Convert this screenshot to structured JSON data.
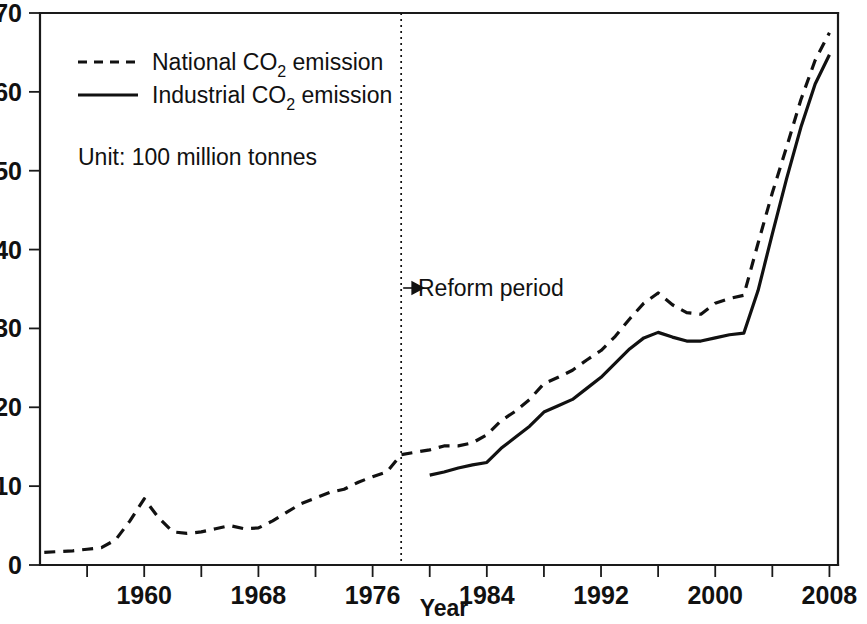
{
  "chart_data": {
    "type": "line",
    "title": "",
    "subtitle": "",
    "xlabel": "Year",
    "ylabel": "",
    "unit_note": "Unit: 100 million tonnes",
    "xlim": [
      1952.7,
      2008.6
    ],
    "ylim": [
      0,
      70
    ],
    "xticks": [
      1960,
      1968,
      1976,
      1984,
      1992,
      2000,
      2008
    ],
    "xtick_labels": [
      "1960",
      "1968",
      "1976",
      "1984",
      "1992",
      "2000",
      "2008"
    ],
    "xminor_ticks": [
      1956,
      1964,
      1972,
      1980,
      1988,
      1996,
      2004
    ],
    "yticks": [
      0,
      10,
      20,
      30,
      40,
      50,
      60,
      70
    ],
    "ytick_labels": [
      "0",
      "10",
      "20",
      "30",
      "40",
      "50",
      "60",
      "70"
    ],
    "grid": false,
    "legend_position": "upper-left",
    "annotations": [
      {
        "name": "reform-period",
        "text": "Reform period",
        "arrow": "→",
        "x": 1978,
        "y": 35,
        "marker": "vertical dotted line at 1978"
      }
    ],
    "series": [
      {
        "name": "National CO2 emission",
        "label_html": "National CO<sub>2</sub> emission",
        "style": "dashed",
        "color": "#111111",
        "x": [
          1953,
          1954,
          1955,
          1956,
          1957,
          1958,
          1959,
          1960,
          1961,
          1962,
          1963,
          1964,
          1965,
          1966,
          1967,
          1968,
          1969,
          1970,
          1971,
          1972,
          1973,
          1974,
          1975,
          1976,
          1977,
          1978,
          1979,
          1980,
          1981,
          1982,
          1983,
          1984,
          1985,
          1986,
          1987,
          1988,
          1989,
          1990,
          1991,
          1992,
          1993,
          1994,
          1995,
          1996,
          1997,
          1998,
          1999,
          2000,
          2001,
          2002,
          2003,
          2004,
          2005,
          2006,
          2007,
          2008
        ],
        "y": [
          1.6,
          1.7,
          1.8,
          2.0,
          2.2,
          3.2,
          5.6,
          8.4,
          6.0,
          4.2,
          4.0,
          4.2,
          4.6,
          5.0,
          4.6,
          4.7,
          5.6,
          6.7,
          7.8,
          8.5,
          9.2,
          9.6,
          10.5,
          11.2,
          11.8,
          14.0,
          14.3,
          14.6,
          15.1,
          15.1,
          15.5,
          16.5,
          18.3,
          19.5,
          21.0,
          23.0,
          23.8,
          24.7,
          26.0,
          27.2,
          29.0,
          31.2,
          33.2,
          34.5,
          33.0,
          32.0,
          31.8,
          33.2,
          33.8,
          34.2,
          40.8,
          47.2,
          53.0,
          59.0,
          64.0,
          67.5
        ]
      },
      {
        "name": "Industrial CO2 emission",
        "label_html": "Industrial CO<sub>2</sub> emission",
        "style": "solid",
        "color": "#111111",
        "x": [
          1980,
          1981,
          1982,
          1983,
          1984,
          1985,
          1986,
          1987,
          1988,
          1989,
          1990,
          1991,
          1992,
          1993,
          1994,
          1995,
          1996,
          1997,
          1998,
          1999,
          2000,
          2001,
          2002,
          2003,
          2004,
          2005,
          2006,
          2007,
          2008
        ],
        "y": [
          11.4,
          11.8,
          12.3,
          12.7,
          13.0,
          14.8,
          16.2,
          17.6,
          19.4,
          20.2,
          21.0,
          22.4,
          23.8,
          25.6,
          27.4,
          28.8,
          29.5,
          28.9,
          28.4,
          28.4,
          28.8,
          29.2,
          29.4,
          34.8,
          42.0,
          49.0,
          55.5,
          61.0,
          64.7
        ]
      }
    ]
  },
  "legend": {
    "entries": [
      {
        "prefix": "National CO",
        "sub": "2",
        "suffix": " emission",
        "style": "dashed"
      },
      {
        "prefix": "Industrial CO",
        "sub": "2",
        "suffix": " emission",
        "style": "solid"
      }
    ],
    "unit_note": "Unit: 100 million tonnes"
  },
  "axes": {
    "x_title": "Year"
  }
}
